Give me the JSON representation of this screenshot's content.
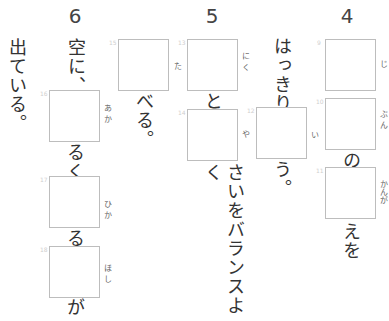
{
  "question_numbers": [
    "6",
    "5",
    "4"
  ],
  "q4": {
    "boxes": [
      {
        "index": "9",
        "ruby": "じ"
      },
      {
        "index": "10",
        "ruby": "ぶん"
      },
      {
        "index": "11",
        "ruby": "かんが"
      }
    ],
    "text_after_10": "の",
    "text_after_11": "えを"
  },
  "q4b": {
    "text_before": "はっきり",
    "boxes": [
      {
        "index": "12",
        "ruby": "い"
      }
    ],
    "text_after": "う。"
  },
  "q5": {
    "boxes": [
      {
        "index": "13",
        "ruby": "にく"
      },
      {
        "index": "14",
        "ruby": "や"
      }
    ],
    "text_between": "と",
    "text_after": "さいをバランスよく"
  },
  "q5b": {
    "boxes": [
      {
        "index": "15",
        "ruby": "た"
      }
    ],
    "text_after": "べる。"
  },
  "q6": {
    "text_before": "空に、",
    "boxes": [
      {
        "index": "16",
        "ruby": "あか"
      },
      {
        "index": "17",
        "ruby": "ひか"
      },
      {
        "index": "18",
        "ruby": "ほし"
      }
    ],
    "text_after_16": "るく",
    "text_after_17": "る",
    "text_after_18": "が"
  },
  "q6b": {
    "text": "出ている。"
  }
}
